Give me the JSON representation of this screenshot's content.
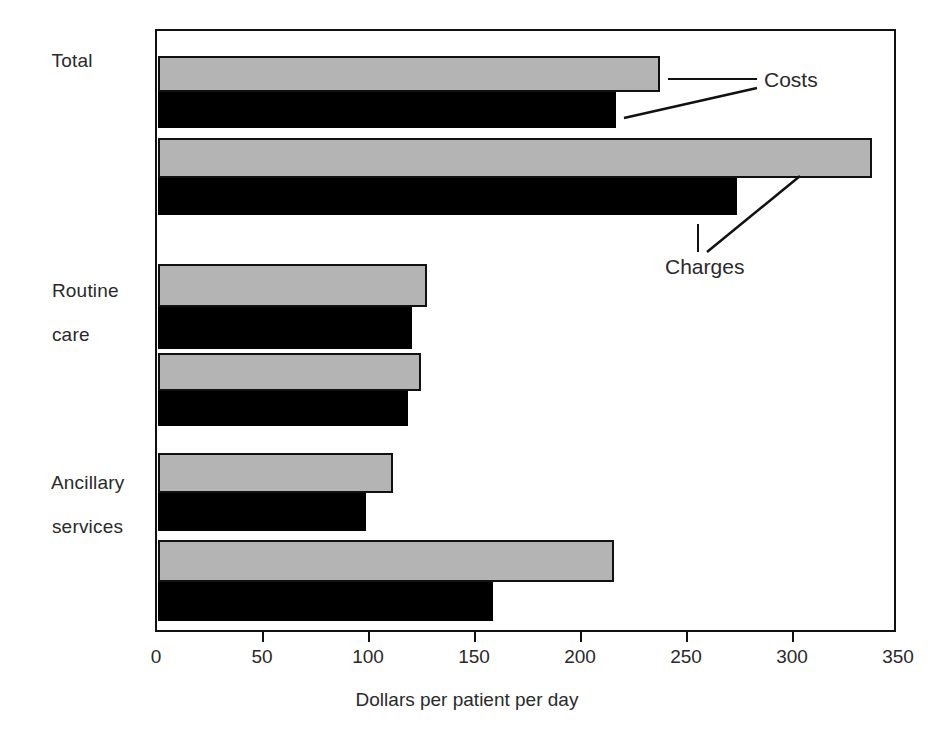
{
  "chart_data": {
    "type": "bar",
    "orientation": "horizontal",
    "title": "",
    "subtitle": "",
    "xlabel": "Dollars per patient per day",
    "ylabel": "",
    "xlim": [
      0,
      350
    ],
    "xticks": [
      0,
      50,
      100,
      150,
      200,
      250,
      300,
      350
    ],
    "xtick_labels": [
      "0",
      "50",
      "100",
      "150",
      "200",
      "250",
      "300",
      "350"
    ],
    "grid": false,
    "legend_position": "annotations-inside-plot",
    "categories": [
      "Total",
      "Routine care",
      "Ancillary services"
    ],
    "category_labels": [
      {
        "line1": "Total",
        "line2": ""
      },
      {
        "line1": "Routine",
        "line2": "care"
      },
      {
        "line1": "Ancillary",
        "line2": "services"
      }
    ],
    "series": [
      {
        "name": "Costs",
        "bar_style": "gray",
        "values": [
          237,
          127,
          111
        ]
      },
      {
        "name": "Costs",
        "bar_style": "black",
        "values": [
          216,
          120,
          98
        ]
      },
      {
        "name": "Charges",
        "bar_style": "gray",
        "values": [
          337,
          124,
          215
        ]
      },
      {
        "name": "Charges",
        "bar_style": "black",
        "values": [
          273,
          118,
          158
        ]
      }
    ],
    "annotations": [
      {
        "text": "Costs",
        "points_to": "Total costs bar pair"
      },
      {
        "text": "Charges",
        "points_to": "Total charges bar pair"
      }
    ],
    "colors": {
      "gray_bar": "#b4b4b4",
      "black_bar": "#000000",
      "axis": "#111111",
      "text": "#2a2a2a",
      "background": "#ffffff"
    }
  },
  "geometry": {
    "plot": {
      "left": 155,
      "top": 29,
      "width": 741,
      "height": 603
    },
    "x_zero_px": 156,
    "px_per_unit": 2.12,
    "bars": [
      {
        "top": 54,
        "height": 36,
        "style": "gray",
        "value_key": "0.0"
      },
      {
        "top": 90,
        "height": 36,
        "style": "black",
        "value_key": "1.0"
      },
      {
        "top": 136,
        "height": 40,
        "style": "gray",
        "value_key": "2.0"
      },
      {
        "top": 176,
        "height": 37,
        "style": "black",
        "value_key": "3.0"
      },
      {
        "top": 262,
        "height": 43,
        "style": "gray",
        "value_key": "0.1"
      },
      {
        "top": 305,
        "height": 42,
        "style": "black",
        "value_key": "1.1"
      },
      {
        "top": 351,
        "height": 38,
        "style": "gray",
        "value_key": "2.1"
      },
      {
        "top": 389,
        "height": 35,
        "style": "black",
        "value_key": "3.1"
      },
      {
        "top": 451,
        "height": 40,
        "style": "gray",
        "value_key": "0.2"
      },
      {
        "top": 491,
        "height": 38,
        "style": "black",
        "value_key": "1.2"
      },
      {
        "top": 538,
        "height": 42,
        "style": "gray",
        "value_key": "2.2"
      },
      {
        "top": 580,
        "height": 39,
        "style": "black",
        "value_key": "3.2"
      }
    ],
    "category_label_positions": [
      {
        "left": 30,
        "top": 28
      },
      {
        "left": 30,
        "top": 258
      },
      {
        "left": 30,
        "top": 450
      }
    ],
    "annotation_positions": [
      {
        "left": 764,
        "top": 68
      },
      {
        "left": 665,
        "top": 255
      }
    ]
  }
}
